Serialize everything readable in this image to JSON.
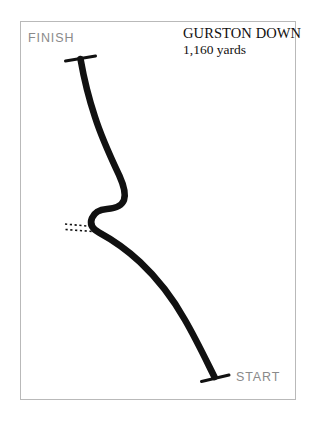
{
  "figure": {
    "kind": "motorsport-hillclimb-course-map",
    "background_color": "#ffffff",
    "frame_color": "#b9b9b9",
    "track_color": "#111111"
  },
  "title_block": {
    "venue": "GURSTON DOWN",
    "length": "1,160 yards"
  },
  "labels": {
    "finish": "FINISH",
    "start": "START",
    "label_color": "#8a8a8a"
  },
  "course": {
    "track_path": "M 80.5 59 C 83.5 76, 88 96, 95 117 C 102 139, 112 160, 119.5 176 C 124 186, 126 194, 124 200 C 121.5 207, 114 208.5, 107 209 C 100.5 209.5, 94.5 212, 92 218 C 89.5 224, 92.5 229, 99 232.5 C 110 238.5, 125 248, 140 262 C 156 277, 172 297, 185 320 C 196 339, 206 360, 214.5 377",
    "track_width": 6.6,
    "finish_marker": {
      "x1": 65.5,
      "y1": 61.0,
      "x2": 95.5,
      "y2": 56.0,
      "width": 3.0
    },
    "start_marker": {
      "x1": 201.5,
      "y1": 381.5,
      "x2": 229.0,
      "y2": 375.0,
      "width": 3.0
    },
    "side_road": {
      "dash_rows": [
        {
          "x1": 65.0,
          "y1": 224.0,
          "x2": 92.0,
          "y2": 226.5
        },
        {
          "x1": 65.5,
          "y1": 229.5,
          "x2": 93.0,
          "y2": 231.5
        }
      ],
      "dash_pattern": "2.2 2.6",
      "width": 1.6
    }
  }
}
